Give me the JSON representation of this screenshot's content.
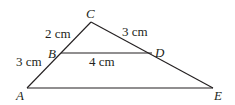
{
  "figure": {
    "points": {
      "A": {
        "label": "A"
      },
      "B": {
        "label": "B"
      },
      "C": {
        "label": "C"
      },
      "D": {
        "label": "D"
      },
      "E": {
        "label": "E"
      }
    },
    "measurements": {
      "CB": "2 cm",
      "BA": "3 cm",
      "CD": "3 cm",
      "BD": "4 cm"
    },
    "colors": {
      "ink": "#231f20",
      "background": "#ffffff"
    }
  }
}
